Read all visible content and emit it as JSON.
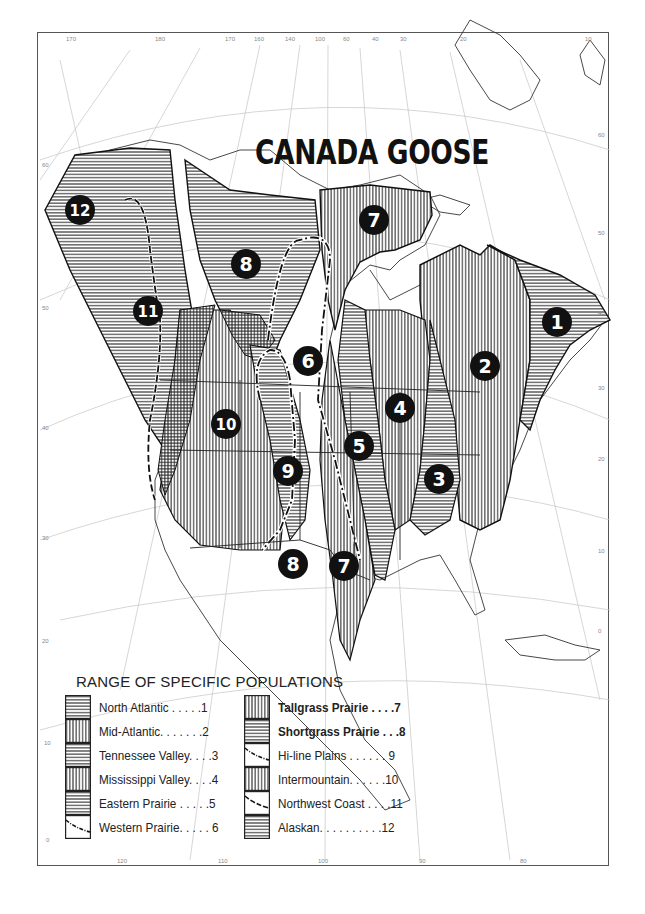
{
  "map": {
    "title": "CANADA GOOSE",
    "top_ticks": [
      "170",
      "180",
      "170",
      "160",
      "140",
      "100",
      "60",
      "40",
      "30",
      "20",
      "10"
    ],
    "bottom_ticks": [
      "120",
      "110",
      "100",
      "90",
      "80"
    ],
    "left_ticks": [
      "60",
      "50",
      "40",
      "30",
      "20",
      "10",
      "0"
    ],
    "right_ticks": [
      "60",
      "50",
      "40",
      "30",
      "20",
      "10",
      "0"
    ],
    "region_markers": [
      {
        "id": "1",
        "name": "North Atlantic"
      },
      {
        "id": "2",
        "name": "Mid-Atlantic"
      },
      {
        "id": "3",
        "name": "Tennessee Valley"
      },
      {
        "id": "4",
        "name": "Mississippi Valley"
      },
      {
        "id": "5",
        "name": "Eastern Prairie"
      },
      {
        "id": "6",
        "name": "Western Prairie"
      },
      {
        "id": "7",
        "name": "Tallgrass Prairie (north)"
      },
      {
        "id": "7",
        "name": "Tallgrass Prairie (south)"
      },
      {
        "id": "8",
        "name": "Shortgrass Prairie (north)"
      },
      {
        "id": "8",
        "name": "Shortgrass Prairie (south)"
      },
      {
        "id": "9",
        "name": "Hi-line Plains"
      },
      {
        "id": "10",
        "name": "Intermountain"
      },
      {
        "id": "11",
        "name": "Northwest Coast"
      },
      {
        "id": "12",
        "name": "Alaskan"
      }
    ]
  },
  "legend": {
    "title": "RANGE OF SPECIFIC POPULATIONS",
    "left_column": [
      {
        "label": "North Atlantic . . . . .1",
        "pattern": "horizontal"
      },
      {
        "label": "Mid-Atlantic. . . . . . .2",
        "pattern": "vertical"
      },
      {
        "label": "Tennessee Valley. . . .3",
        "pattern": "horizontal"
      },
      {
        "label": "Mississippi Valley. . . .4",
        "pattern": "vertical"
      },
      {
        "label": "Eastern Prairie . . . . .5",
        "pattern": "horizontal"
      },
      {
        "label": "Western Prairie. . . . . 6",
        "pattern": "dash-dot-line"
      }
    ],
    "right_column": [
      {
        "label": "Tallgrass Prairie  . . . .7",
        "pattern": "vertical"
      },
      {
        "label": "Shortgrass Prairie  . . .8",
        "pattern": "horizontal"
      },
      {
        "label": "Hi-line Plains . . . . . . 9",
        "pattern": "dash-dot-line"
      },
      {
        "label": "Intermountain. . . . . .10",
        "pattern": "vertical"
      },
      {
        "label": "Northwest Coast . . . .11",
        "pattern": "dash-line"
      },
      {
        "label": "Alaskan. . . . . . . . . .12",
        "pattern": "horizontal"
      }
    ]
  },
  "colors": {
    "ink": "#1a1a1a",
    "hatch": "#333333",
    "grid": "#bbbbbb",
    "background": "#ffffff"
  }
}
